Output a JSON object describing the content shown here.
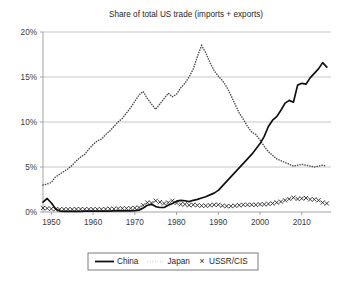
{
  "chart_data": {
    "type": "line",
    "title": "Share of total US trade (imports + exports)",
    "xlabel": "",
    "ylabel": "",
    "xlim": [
      1948,
      2017
    ],
    "ylim": [
      0,
      20
    ],
    "grid": true,
    "grid_axis": "y",
    "legend_position": "bottom-center",
    "ytick_labels": [
      "0%",
      "5%",
      "10%",
      "15%",
      "20%"
    ],
    "ytick_values": [
      0,
      5,
      10,
      15,
      20
    ],
    "xtick_labels": [
      "1950",
      "1960",
      "1970",
      "1980",
      "1990",
      "2000",
      "2010"
    ],
    "xtick_values": [
      1950,
      1960,
      1970,
      1980,
      1990,
      2000,
      2010
    ],
    "x": [
      1948,
      1949,
      1950,
      1951,
      1952,
      1953,
      1954,
      1955,
      1956,
      1957,
      1958,
      1959,
      1960,
      1961,
      1962,
      1963,
      1964,
      1965,
      1966,
      1967,
      1968,
      1969,
      1970,
      1971,
      1972,
      1973,
      1974,
      1975,
      1976,
      1977,
      1978,
      1979,
      1980,
      1981,
      1982,
      1983,
      1984,
      1985,
      1986,
      1987,
      1988,
      1989,
      1990,
      1991,
      1992,
      1993,
      1994,
      1995,
      1996,
      1997,
      1998,
      1999,
      2000,
      2001,
      2002,
      2003,
      2004,
      2005,
      2006,
      2007,
      2008,
      2009,
      2010,
      2011,
      2012,
      2013,
      2014,
      2015,
      2016
    ],
    "series": [
      {
        "name": "China",
        "style": "solid",
        "values": [
          1.1,
          1.5,
          1.0,
          0.35,
          0.1,
          0.08,
          0.07,
          0.07,
          0.08,
          0.08,
          0.09,
          0.09,
          0.1,
          0.1,
          0.1,
          0.1,
          0.1,
          0.12,
          0.12,
          0.12,
          0.12,
          0.13,
          0.15,
          0.2,
          0.45,
          0.75,
          0.85,
          0.6,
          0.5,
          0.5,
          0.75,
          0.95,
          1.2,
          1.3,
          1.25,
          1.15,
          1.3,
          1.4,
          1.55,
          1.7,
          1.9,
          2.1,
          2.4,
          2.9,
          3.4,
          3.9,
          4.4,
          4.9,
          5.4,
          5.9,
          6.4,
          7.0,
          7.6,
          8.4,
          9.5,
          10.2,
          10.6,
          11.3,
          12.1,
          12.4,
          12.2,
          14.1,
          14.3,
          14.2,
          14.9,
          15.4,
          15.9,
          16.6,
          16.1
        ]
      },
      {
        "name": "Japan",
        "style": "dotted",
        "values": [
          3.0,
          3.1,
          3.3,
          3.9,
          4.2,
          4.5,
          4.8,
          5.2,
          5.7,
          6.1,
          6.4,
          7.0,
          7.5,
          7.9,
          8.1,
          8.6,
          9.0,
          9.5,
          10.0,
          10.4,
          11.0,
          11.6,
          12.3,
          13.0,
          13.4,
          12.6,
          12.0,
          11.4,
          12.0,
          12.6,
          13.2,
          12.8,
          13.1,
          13.8,
          14.3,
          15.0,
          15.9,
          17.3,
          18.5,
          17.7,
          16.6,
          15.7,
          15.1,
          14.6,
          13.9,
          13.0,
          12.0,
          11.0,
          10.3,
          9.5,
          8.9,
          8.6,
          8.0,
          7.3,
          6.7,
          6.3,
          5.9,
          5.7,
          5.5,
          5.3,
          5.1,
          5.2,
          5.3,
          5.2,
          5.1,
          5.0,
          5.1,
          5.2,
          5.1
        ]
      },
      {
        "name": "USSR/CIS",
        "style": "markers",
        "marker": "x",
        "values": [
          0.45,
          0.4,
          0.35,
          0.3,
          0.3,
          0.3,
          0.3,
          0.3,
          0.32,
          0.32,
          0.3,
          0.3,
          0.3,
          0.3,
          0.3,
          0.32,
          0.35,
          0.35,
          0.38,
          0.4,
          0.4,
          0.42,
          0.45,
          0.5,
          0.75,
          1.05,
          1.0,
          1.25,
          1.1,
          0.95,
          1.05,
          1.25,
          1.0,
          0.85,
          0.85,
          0.75,
          0.8,
          0.75,
          0.7,
          0.7,
          0.75,
          0.8,
          0.8,
          0.7,
          0.65,
          0.65,
          0.7,
          0.75,
          0.8,
          0.8,
          0.8,
          0.8,
          0.85,
          0.85,
          0.9,
          0.95,
          1.05,
          1.15,
          1.3,
          1.45,
          1.6,
          1.45,
          1.5,
          1.55,
          1.4,
          1.4,
          1.3,
          1.05,
          0.95
        ]
      }
    ],
    "legend": [
      {
        "label": "China",
        "style": "solid"
      },
      {
        "label": "Japan",
        "style": "dotted"
      },
      {
        "label": "USSR/CIS",
        "style": "marker-x"
      }
    ]
  }
}
